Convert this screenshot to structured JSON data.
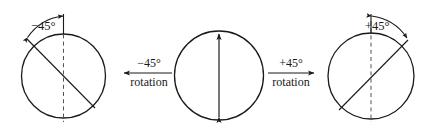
{
  "figure": {
    "background": "#ffffff",
    "stroke_color": "#1a1a1a",
    "panels": [
      {
        "id": "left-panel",
        "name": "circle-rotated-minus-45",
        "angle_label": "−45°",
        "axis_style": "solid-diagonal",
        "reference_axis_style": "dashed-vertical",
        "arc_arrowheads": "both",
        "rotation_degrees": -45
      },
      {
        "id": "middle-panel",
        "name": "circle-unrotated",
        "angle_label": "",
        "axis_style": "double-headed-vertical-arrow",
        "reference_axis_style": "none",
        "rotation_degrees": 0
      },
      {
        "id": "right-panel",
        "name": "circle-rotated-plus-45",
        "angle_label": "+45°",
        "axis_style": "solid-diagonal",
        "reference_axis_style": "dashed-vertical",
        "arc_arrowheads": "both",
        "rotation_degrees": 45
      }
    ],
    "transitions": [
      {
        "id": "left-transition",
        "name": "minus-45-rotation-arrow",
        "numerator": "−45°",
        "denominator": "rotation",
        "direction": "left"
      },
      {
        "id": "right-transition",
        "name": "plus-45-rotation-arrow",
        "numerator": "+45°",
        "denominator": "rotation",
        "direction": "right"
      }
    ]
  }
}
